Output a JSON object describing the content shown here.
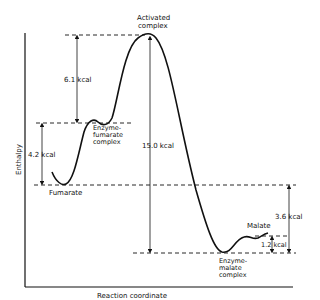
{
  "diagram": {
    "type": "energy-profile",
    "axes": {
      "y_label": "Enthalpy",
      "x_label": "Reaction coordinate"
    },
    "states": {
      "activated_complex": "Activated complex",
      "activated_line1": "Activated",
      "activated_line2": "complex",
      "enzyme_fumarate_line1": "Enzyme-",
      "enzyme_fumarate_line2": "fumarate",
      "enzyme_fumarate_line3": "complex",
      "fumarate": "Fumarate",
      "malate": "Malate",
      "enzyme_malate_line1": "Enzyme-",
      "enzyme_malate_line2": "malate",
      "enzyme_malate_line3": "complex"
    },
    "energy_gaps": {
      "ef_to_activated": "6.1 kcal",
      "fumarate_to_ef": "4.2 kcal",
      "activated_to_em": "15.0 kcal",
      "fumarate_to_em": "3.6 kcal",
      "em_to_malate": "1.2 kcal"
    },
    "color": "#111111"
  }
}
